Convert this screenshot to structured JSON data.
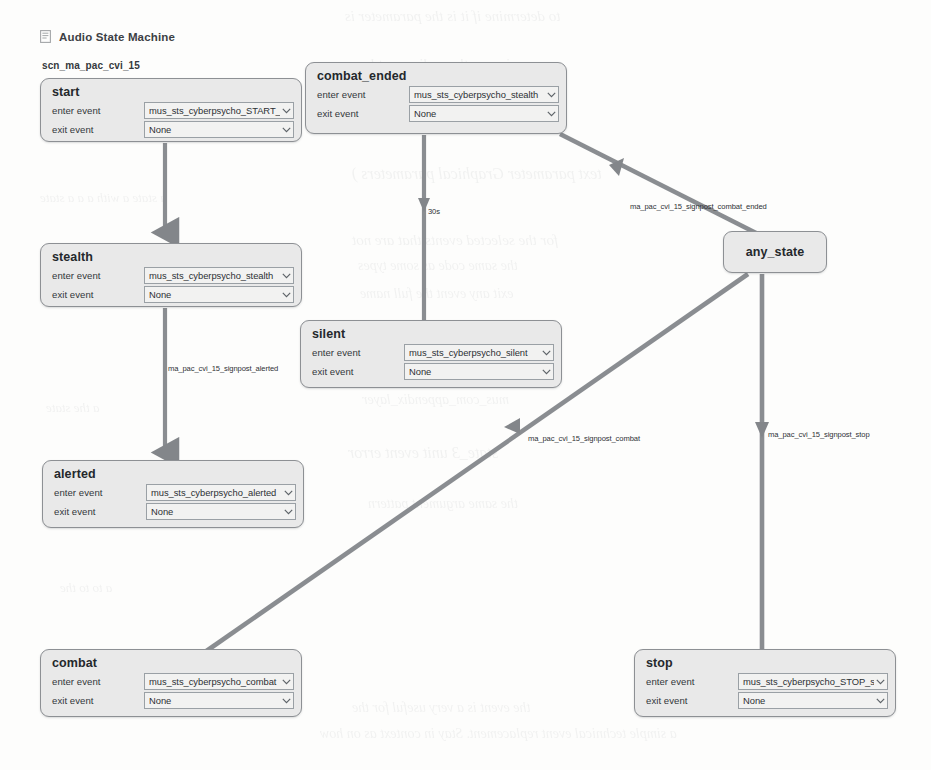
{
  "header": {
    "icon": "document-state-machine-icon",
    "title": "Audio State Machine"
  },
  "graph": {
    "name": "scn_ma_pac_cvi_15",
    "row_labels": {
      "enter": "enter event",
      "exit": "exit event"
    },
    "colors": {
      "node_fill": "#e9e9e9",
      "node_border": "#8d9094",
      "edge": "#8a8d91",
      "text": "#24282c"
    },
    "nodes": [
      {
        "id": "start",
        "title": "start",
        "enter_event": "mus_sts_cyberpsycho_START_si",
        "exit_event": "None",
        "x": 40,
        "y": 78,
        "w": 262,
        "h": 64
      },
      {
        "id": "combat_ended",
        "title": "combat_ended",
        "enter_event": "mus_sts_cyberpsycho_stealth",
        "exit_event": "None",
        "x": 305,
        "y": 62,
        "w": 262,
        "h": 72
      },
      {
        "id": "stealth",
        "title": "stealth",
        "enter_event": "mus_sts_cyberpsycho_stealth",
        "exit_event": "None",
        "x": 40,
        "y": 243,
        "w": 262,
        "h": 64
      },
      {
        "id": "silent",
        "title": "silent",
        "enter_event": "mus_sts_cyberpsycho_silent",
        "exit_event": "None",
        "x": 300,
        "y": 320,
        "w": 262,
        "h": 68
      },
      {
        "id": "alerted",
        "title": "alerted",
        "enter_event": "mus_sts_cyberpsycho_alerted",
        "exit_event": "None",
        "x": 42,
        "y": 460,
        "w": 262,
        "h": 68
      },
      {
        "id": "combat",
        "title": "combat",
        "enter_event": "mus_sts_cyberpsycho_combat",
        "exit_event": "None",
        "x": 40,
        "y": 649,
        "w": 262,
        "h": 68
      },
      {
        "id": "stop",
        "title": "stop",
        "enter_event": "mus_sts_cyberpsycho_STOP_sl",
        "exit_event": "None",
        "x": 634,
        "y": 649,
        "w": 262,
        "h": 68
      }
    ],
    "any_state": {
      "id": "any_state",
      "title": "any_state",
      "x": 723,
      "y": 231,
      "w": 104,
      "h": 42
    },
    "edges": [
      {
        "id": "start-to-stealth",
        "from": "start",
        "to": "stealth",
        "label": ""
      },
      {
        "id": "combat_ended-to-silent",
        "from": "combat_ended",
        "to": "silent",
        "label": "30s",
        "label_x": 428,
        "label_y": 207
      },
      {
        "id": "stealth-to-alerted",
        "from": "stealth",
        "to": "alerted",
        "label": "ma_pac_cvi_15_signpost_alerted",
        "label_x": 168,
        "label_y": 364
      },
      {
        "id": "combat_ended-to-any_state",
        "from": "combat_ended",
        "to": "any_state",
        "label": "ma_pac_cvi_15_signpost_combat_ended",
        "label_x": 630,
        "label_y": 202
      },
      {
        "id": "any_state-to-combat",
        "from": "any_state",
        "to": "combat",
        "label": "ma_pac_cvi_15_signpost_combat",
        "label_x": 528,
        "label_y": 434
      },
      {
        "id": "any_state-to-stop",
        "from": "any_state",
        "to": "stop",
        "label": "ma_pac_cvi_15_signpost_stop",
        "label_x": 768,
        "label_y": 430
      }
    ]
  },
  "background_bleed": [
    {
      "text": "to determine if it is the parameter is",
      "x": 345,
      "y": 8,
      "size": 15
    },
    {
      "text": "ignore the audio asset key",
      "x": 355,
      "y": 56,
      "size": 15
    },
    {
      "text": "how to get the same version",
      "x": 350,
      "y": 84,
      "size": 15
    },
    {
      "text": "text parameter  Graphical parameters )",
      "x": 352,
      "y": 165,
      "size": 16
    },
    {
      "text": "for the selected events that are not",
      "x": 352,
      "y": 232,
      "size": 15
    },
    {
      "text": "the same code as some types",
      "x": 358,
      "y": 258,
      "size": 14
    },
    {
      "text": "exit  any event  the full name",
      "x": 360,
      "y": 286,
      "size": 14
    },
    {
      "text": "mus_com_appendix_layer",
      "x": 362,
      "y": 392,
      "size": 14
    },
    {
      "text": "state_3     unit event  error",
      "x": 348,
      "y": 444,
      "size": 16
    },
    {
      "text": "the same argument pattern",
      "x": 368,
      "y": 496,
      "size": 14
    },
    {
      "text": "the event is a very useful for the",
      "x": 352,
      "y": 700,
      "size": 14
    },
    {
      "text": "a simple technical event replacement. Stay in context as on how",
      "x": 320,
      "y": 726,
      "size": 14
    },
    {
      "text": "a state a with a a a state",
      "x": 40,
      "y": 190,
      "size": 13
    },
    {
      "text": "a the state",
      "x": 46,
      "y": 400,
      "size": 13
    },
    {
      "text": "a to to the",
      "x": 60,
      "y": 580,
      "size": 13
    }
  ]
}
